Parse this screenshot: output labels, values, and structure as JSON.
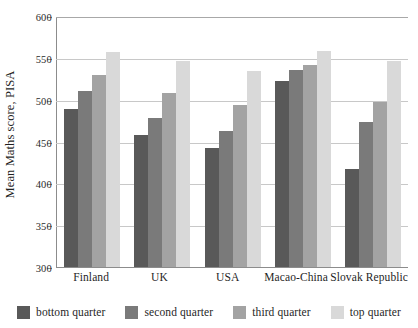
{
  "chart_data": {
    "type": "bar",
    "title": "",
    "xlabel": "",
    "ylabel": "Mean Maths score, PISA",
    "ylim": [
      300,
      600
    ],
    "ytick_step": 50,
    "yticks": [
      300,
      350,
      400,
      450,
      500,
      550,
      600
    ],
    "grid": true,
    "legend_position": "bottom",
    "categories": [
      "Finland",
      "UK",
      "USA",
      "Macao-China",
      "Slovak Republic"
    ],
    "series": [
      {
        "name": "bottom quarter",
        "color": "#595959",
        "values": [
          489,
          458,
          442,
          522,
          417
        ]
      },
      {
        "name": "second quarter",
        "color": "#7a7a7a",
        "values": [
          510,
          478,
          463,
          535,
          473
        ]
      },
      {
        "name": "third quarter",
        "color": "#a3a3a3",
        "values": [
          530,
          508,
          494,
          542,
          497
        ]
      },
      {
        "name": "top quarter",
        "color": "#d9d9d9",
        "values": [
          557,
          546,
          534,
          558,
          546
        ]
      }
    ]
  },
  "axis": {
    "y_title": "Mean Maths score, PISA",
    "y_tick_labels": [
      "600",
      "550",
      "500",
      "450",
      "400",
      "350",
      "300"
    ]
  },
  "legend": {
    "items": [
      {
        "label": "bottom quarter"
      },
      {
        "label": "second quarter"
      },
      {
        "label": "third quarter"
      },
      {
        "label": "top quarter"
      }
    ]
  },
  "colors": {
    "gridline": "#c8c8c8",
    "axis": "#8c8c8c",
    "text": "#1f1f1f",
    "background": "#ffffff"
  }
}
